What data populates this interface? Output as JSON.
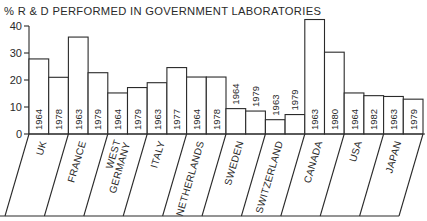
{
  "chart_data": {
    "type": "bar",
    "title": "% R & D PERFORMED IN GOVERNMENT LABORATORIES",
    "xlabel": "",
    "ylabel": "%",
    "ylim": [
      0,
      40
    ],
    "yticks": [
      0,
      10,
      20,
      30,
      40
    ],
    "grid": false,
    "legend": null,
    "categories": [
      "UK",
      "FRANCE",
      "WEST GERMANY",
      "ITALY",
      "NETHERLANDS",
      "SWEDEN",
      "SWITZERLAND",
      "CANADA",
      "USA",
      "JAPAN"
    ],
    "groups": [
      {
        "country": "UK",
        "label_lines": [
          "UK"
        ],
        "bars": [
          {
            "year": "1964",
            "value": 27.8
          },
          {
            "year": "1978",
            "value": 21.0
          }
        ]
      },
      {
        "country": "FRANCE",
        "label_lines": [
          "FRANCE"
        ],
        "bars": [
          {
            "year": "1963",
            "value": 35.9
          },
          {
            "year": "1979",
            "value": 22.7
          }
        ]
      },
      {
        "country": "WEST GERMANY",
        "label_lines": [
          "WEST",
          "GERMANY"
        ],
        "bars": [
          {
            "year": "1964",
            "value": 15.2
          },
          {
            "year": "1979",
            "value": 17.2
          }
        ]
      },
      {
        "country": "ITALY",
        "label_lines": [
          "ITALY"
        ],
        "bars": [
          {
            "year": "1963",
            "value": 19.0
          },
          {
            "year": "1977",
            "value": 24.6
          }
        ]
      },
      {
        "country": "NETHERLANDS",
        "label_lines": [
          "NETHERLANDS"
        ],
        "bars": [
          {
            "year": "1964",
            "value": 21.1
          },
          {
            "year": "1978",
            "value": 21.1
          }
        ]
      },
      {
        "country": "SWEDEN",
        "label_lines": [
          "SWEDEN"
        ],
        "bars": [
          {
            "year": "1964",
            "value": 9.4
          },
          {
            "year": "1979",
            "value": 8.5
          }
        ]
      },
      {
        "country": "SWITZERLAND",
        "label_lines": [
          "SWITZERLAND"
        ],
        "bars": [
          {
            "year": "1963",
            "value": 5.3
          },
          {
            "year": "1979",
            "value": 7.2
          }
        ]
      },
      {
        "country": "CANADA",
        "label_lines": [
          "CANADA"
        ],
        "bars": [
          {
            "year": "1963",
            "value": 42.4
          },
          {
            "year": "1980",
            "value": 30.3
          }
        ]
      },
      {
        "country": "USA",
        "label_lines": [
          "USA"
        ],
        "bars": [
          {
            "year": "1964",
            "value": 15.2
          },
          {
            "year": "1982",
            "value": 14.2
          }
        ]
      },
      {
        "country": "JAPAN",
        "label_lines": [
          "JAPAN"
        ],
        "bars": [
          {
            "year": "1963",
            "value": 13.9
          },
          {
            "year": "1979",
            "value": 12.9
          }
        ]
      }
    ],
    "series": [
      {
        "name": "earlier year",
        "values": [
          27.8,
          35.9,
          15.2,
          19.0,
          21.1,
          9.4,
          5.3,
          42.4,
          15.2,
          13.9
        ]
      },
      {
        "name": "later year",
        "values": [
          21.0,
          22.7,
          17.2,
          24.6,
          21.1,
          8.5,
          7.2,
          30.3,
          14.2,
          12.9
        ]
      }
    ]
  },
  "colors": {
    "ink": "#2a2a2a",
    "background": "#ffffff",
    "bar_fill": "#ffffff"
  }
}
